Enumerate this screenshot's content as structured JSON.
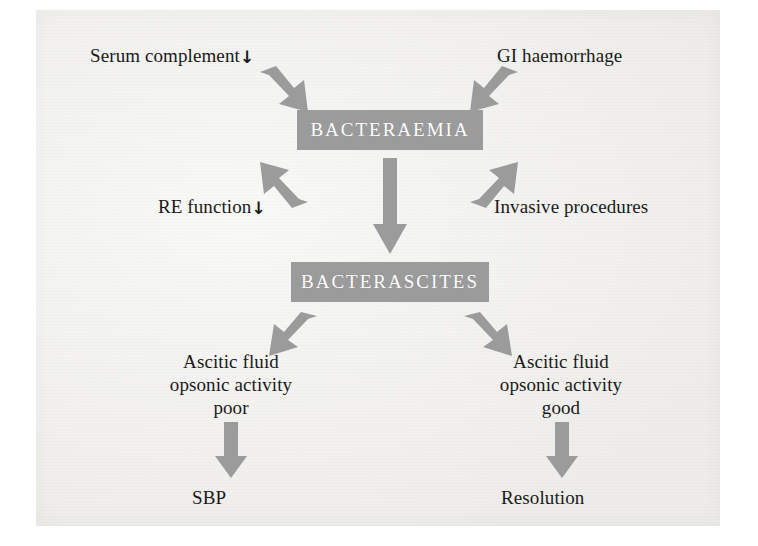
{
  "figure": {
    "type": "flow-diagram",
    "background_color": "#f2f1ee",
    "accent_color": "#9b9b9b",
    "text_color": "#1a1a1a",
    "box_text_color": "#ffffff"
  },
  "nodes": {
    "serum_complement": {
      "label": "Serum complement",
      "suffix_icon": "↓"
    },
    "gi_haemorrhage": {
      "label": "GI haemorrhage"
    },
    "re_function": {
      "label": "RE function",
      "suffix_icon": "↓"
    },
    "invasive_procedures": {
      "label": "Invasive procedures"
    },
    "bacteraemia": {
      "label": "BACTERAEMIA"
    },
    "bacterascites": {
      "label": "BACTERASCITES"
    },
    "ascitic_poor": {
      "line1": "Ascitic fluid",
      "line2": "opsonic activity",
      "line3": "poor"
    },
    "ascitic_good": {
      "line1": "Ascitic fluid",
      "line2": "opsonic activity",
      "line3": "good"
    },
    "sbp": {
      "label": "SBP"
    },
    "resolution": {
      "label": "Resolution"
    }
  },
  "edges": [
    {
      "from": "serum_complement",
      "to": "bacteraemia",
      "direction": "down-right"
    },
    {
      "from": "gi_haemorrhage",
      "to": "bacteraemia",
      "direction": "down-left"
    },
    {
      "from": "re_function",
      "to": "bacteraemia",
      "direction": "up-right"
    },
    {
      "from": "invasive_procedures",
      "to": "bacteraemia",
      "direction": "up-left"
    },
    {
      "from": "bacteraemia",
      "to": "bacterascites",
      "direction": "down"
    },
    {
      "from": "bacterascites",
      "to": "ascitic_poor",
      "direction": "down-left"
    },
    {
      "from": "bacterascites",
      "to": "ascitic_good",
      "direction": "down-right"
    },
    {
      "from": "ascitic_poor",
      "to": "sbp",
      "direction": "down"
    },
    {
      "from": "ascitic_good",
      "to": "resolution",
      "direction": "down"
    }
  ]
}
